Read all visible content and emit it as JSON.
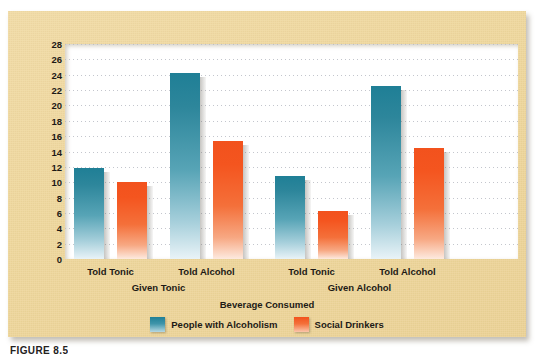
{
  "chart_data": {
    "type": "bar",
    "title": "",
    "xlabel": "Beverage Consumed",
    "ylabel": "Fluid Ounces Consumed",
    "ylim": [
      0,
      28
    ],
    "yticks": [
      0,
      2,
      4,
      6,
      8,
      10,
      12,
      14,
      16,
      18,
      20,
      22,
      24,
      26,
      28
    ],
    "grid": true,
    "legend_position": "bottom",
    "categories": [
      "Told Tonic",
      "Told Alcohol",
      "Told Tonic",
      "Told Alcohol"
    ],
    "group_labels": [
      "Given Tonic",
      "Given Alcohol"
    ],
    "series": [
      {
        "name": "People with Alcoholism",
        "color": "#1f7f96",
        "values": [
          11.8,
          24.2,
          10.8,
          22.5
        ]
      },
      {
        "name": "Social Drinkers",
        "color": "#f2521d",
        "values": [
          10.0,
          15.4,
          6.3,
          14.5
        ]
      }
    ]
  },
  "figure": {
    "panel_color": "#efd79c",
    "caption": "FIGURE 8.5"
  }
}
